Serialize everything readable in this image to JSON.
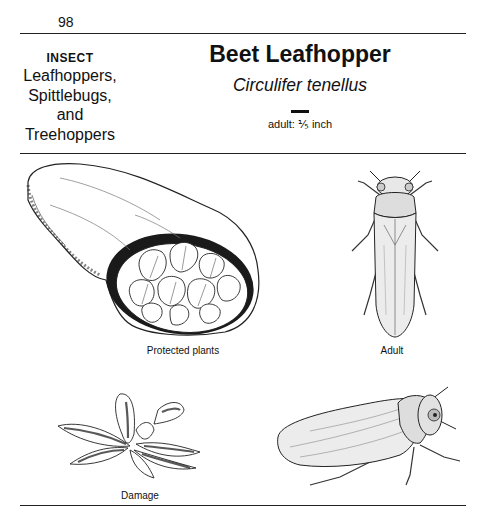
{
  "page": {
    "number": "98"
  },
  "category": {
    "label": "INSECT",
    "group_lines": [
      "Leafhoppers,",
      "Spittlebugs,",
      "and",
      "Treehoppers"
    ]
  },
  "species": {
    "common_name": "Beet Leafhopper",
    "scientific_name": "Circulifer tenellus",
    "size_label": "adult: ⅕ inch"
  },
  "illustrations": [
    {
      "id": "protected-plants",
      "caption": "Protected plants",
      "icon": "row-cover-with-beet-plants-illustration"
    },
    {
      "id": "adult-dorsal",
      "caption": "Adult",
      "icon": "leafhopper-dorsal-view-illustration"
    },
    {
      "id": "damage",
      "caption": "Damage",
      "icon": "damaged-beet-plant-illustration"
    },
    {
      "id": "adult-side",
      "caption": "",
      "icon": "leafhopper-side-view-illustration"
    }
  ]
}
